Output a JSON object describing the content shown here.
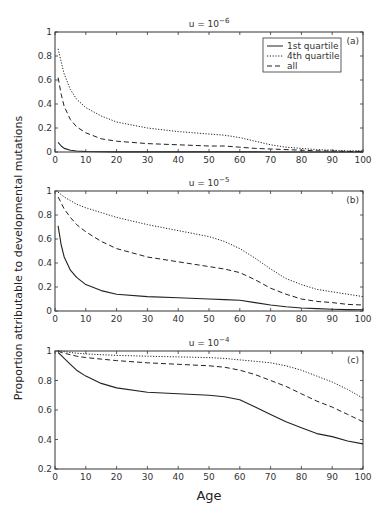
{
  "chart_data": [
    {
      "panel": "(a)",
      "type": "line",
      "title": "u = 10^-6",
      "title_base": "u = 10",
      "title_exp": "−6",
      "xlabel": "Age",
      "ylabel": "Proportion attributable to developmental mutations",
      "xlim": [
        0,
        100
      ],
      "ylim": [
        0,
        1
      ],
      "xticks": [
        0,
        10,
        20,
        30,
        40,
        50,
        60,
        70,
        80,
        90,
        100
      ],
      "yticks": [
        0,
        0.2,
        0.4,
        0.6,
        0.8,
        1
      ],
      "ytick_labels": [
        "0",
        "0.2",
        "0.4",
        "0.6",
        "0.8",
        "1"
      ],
      "grid": false,
      "legend_position": "upper right",
      "legend": [
        "1st quartile",
        "4th quartile",
        "all"
      ],
      "x": [
        1,
        2,
        3,
        5,
        7,
        10,
        15,
        20,
        30,
        40,
        50,
        55,
        60,
        65,
        70,
        75,
        80,
        85,
        90,
        95,
        100
      ],
      "series": [
        {
          "name": "1st quartile",
          "style": "solid",
          "values": [
            0.08,
            0.05,
            0.03,
            0.015,
            0.008,
            0.004,
            0.002,
            0.001,
            0.001,
            0.001,
            0.001,
            0.001,
            0.001,
            0.001,
            0.0,
            0.0,
            0.0,
            0.0,
            0.0,
            0.0,
            0.0
          ]
        },
        {
          "name": "4th quartile",
          "style": "dotted",
          "values": [
            0.86,
            0.75,
            0.65,
            0.52,
            0.44,
            0.37,
            0.3,
            0.25,
            0.2,
            0.17,
            0.15,
            0.14,
            0.12,
            0.09,
            0.06,
            0.04,
            0.03,
            0.02,
            0.015,
            0.01,
            0.01
          ]
        },
        {
          "name": "all",
          "style": "dashed",
          "values": [
            0.62,
            0.48,
            0.38,
            0.27,
            0.21,
            0.16,
            0.11,
            0.09,
            0.07,
            0.06,
            0.05,
            0.05,
            0.04,
            0.03,
            0.025,
            0.02,
            0.015,
            0.01,
            0.008,
            0.005,
            0.005
          ]
        }
      ]
    },
    {
      "panel": "(b)",
      "type": "line",
      "title": "u = 10^-5",
      "title_base": "u = 10",
      "title_exp": "−5",
      "xlim": [
        0,
        100
      ],
      "ylim": [
        0,
        1
      ],
      "xticks": [
        0,
        10,
        20,
        30,
        40,
        50,
        60,
        70,
        80,
        90,
        100
      ],
      "yticks": [
        0,
        0.2,
        0.4,
        0.6,
        0.8,
        1
      ],
      "ytick_labels": [
        "0",
        "0.2",
        "0.4",
        "0.6",
        "0.8",
        "1"
      ],
      "grid": false,
      "x": [
        1,
        2,
        3,
        5,
        7,
        10,
        15,
        20,
        30,
        40,
        50,
        55,
        60,
        65,
        70,
        75,
        80,
        85,
        90,
        95,
        100
      ],
      "series": [
        {
          "name": "1st quartile",
          "style": "solid",
          "values": [
            0.71,
            0.55,
            0.45,
            0.34,
            0.28,
            0.22,
            0.17,
            0.14,
            0.12,
            0.11,
            0.1,
            0.095,
            0.09,
            0.07,
            0.05,
            0.035,
            0.025,
            0.02,
            0.015,
            0.012,
            0.01
          ]
        },
        {
          "name": "4th quartile",
          "style": "dotted",
          "values": [
            0.99,
            0.97,
            0.95,
            0.92,
            0.89,
            0.86,
            0.82,
            0.78,
            0.72,
            0.67,
            0.62,
            0.58,
            0.52,
            0.44,
            0.35,
            0.27,
            0.22,
            0.18,
            0.16,
            0.14,
            0.12
          ]
        },
        {
          "name": "all",
          "style": "dashed",
          "values": [
            0.95,
            0.9,
            0.85,
            0.78,
            0.72,
            0.66,
            0.58,
            0.52,
            0.45,
            0.41,
            0.37,
            0.35,
            0.32,
            0.26,
            0.19,
            0.14,
            0.1,
            0.08,
            0.07,
            0.055,
            0.05
          ]
        }
      ]
    },
    {
      "panel": "(c)",
      "type": "line",
      "title": "u = 10^-4",
      "title_base": "u = 10",
      "title_exp": "−4",
      "xlim": [
        0,
        100
      ],
      "ylim": [
        0.2,
        1
      ],
      "xticks": [
        0,
        10,
        20,
        30,
        40,
        50,
        60,
        70,
        80,
        90,
        100
      ],
      "yticks": [
        0.2,
        0.4,
        0.6,
        0.8,
        1
      ],
      "ytick_labels": [
        "0.2",
        "0.4",
        "0.6",
        "0.8",
        "1"
      ],
      "grid": false,
      "x": [
        1,
        2,
        3,
        5,
        7,
        10,
        15,
        20,
        30,
        40,
        50,
        55,
        60,
        65,
        70,
        75,
        80,
        85,
        90,
        95,
        100
      ],
      "series": [
        {
          "name": "1st quartile",
          "style": "solid",
          "values": [
            0.99,
            0.97,
            0.95,
            0.91,
            0.87,
            0.83,
            0.78,
            0.75,
            0.72,
            0.71,
            0.7,
            0.69,
            0.67,
            0.62,
            0.57,
            0.52,
            0.48,
            0.44,
            0.42,
            0.39,
            0.37
          ]
        },
        {
          "name": "4th quartile",
          "style": "dotted",
          "values": [
            1.0,
            1.0,
            0.995,
            0.99,
            0.985,
            0.98,
            0.975,
            0.97,
            0.965,
            0.96,
            0.955,
            0.95,
            0.94,
            0.93,
            0.92,
            0.9,
            0.87,
            0.83,
            0.79,
            0.74,
            0.68
          ]
        },
        {
          "name": "all",
          "style": "dashed",
          "values": [
            1.0,
            0.99,
            0.985,
            0.975,
            0.965,
            0.955,
            0.945,
            0.935,
            0.92,
            0.91,
            0.9,
            0.89,
            0.87,
            0.84,
            0.8,
            0.76,
            0.71,
            0.66,
            0.62,
            0.57,
            0.52
          ]
        }
      ]
    }
  ],
  "figure": {
    "ylabel": "Proportion attributable to developmental mutations",
    "xlabel": "Age",
    "legend": {
      "items": [
        {
          "label": "1st quartile",
          "style": "solid"
        },
        {
          "label": "4th quartile",
          "style": "dotted"
        },
        {
          "label": "all",
          "style": "dashed"
        }
      ]
    },
    "colors": {
      "line": "#222222",
      "axis": "#333333",
      "background": "#ffffff"
    }
  }
}
